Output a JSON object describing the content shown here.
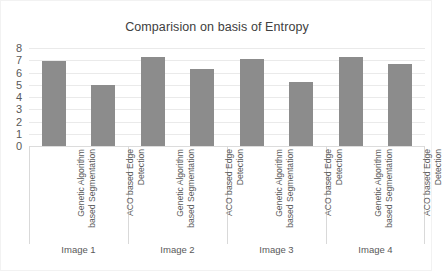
{
  "chart_data": {
    "type": "bar",
    "title": "Comparision on basis of Entropy",
    "xlabel": "",
    "ylabel": "",
    "ylim": [
      0,
      8
    ],
    "yticks": [
      "0",
      "1",
      "2",
      "3",
      "4",
      "5",
      "6",
      "7",
      "8"
    ],
    "grid": true,
    "legend": "none",
    "bar_color": "#8c8c8c",
    "groups": [
      "Image 1",
      "Image 2",
      "Image 3",
      "Image 4"
    ],
    "categories": [
      "Genetic Algorithm based Segmentation",
      "ACO based Edge Detection",
      "Genetic Algorithm based Segmentation",
      "ACO based Edge Detection",
      "Genetic Algorithm based Segmentation",
      "ACO based Edge Detection",
      "Genetic Algorithm based Segmentation",
      "ACO based Edge Detection"
    ],
    "category_lines": [
      [
        "Genetic Algorithm",
        "based Segmentation"
      ],
      [
        "ACO based Edge",
        "Detection"
      ],
      [
        "Genetic Algorithm",
        "based Segmentation"
      ],
      [
        "ACO based Edge",
        "Detection"
      ],
      [
        "Genetic Algorithm",
        "based Segmentation"
      ],
      [
        "ACO based Edge",
        "Detection"
      ],
      [
        "Genetic Algorithm",
        "based Segmentation"
      ],
      [
        "ACO based Edge",
        "Detection"
      ]
    ],
    "values": [
      6.9,
      5.0,
      7.3,
      6.3,
      7.1,
      5.2,
      7.3,
      6.7
    ],
    "series": [
      {
        "name": "Entropy",
        "values": [
          6.9,
          5.0,
          7.3,
          6.3,
          7.1,
          5.2,
          7.3,
          6.7
        ]
      }
    ]
  },
  "axis": {
    "y_tick_0": "0",
    "y_tick_1": "1",
    "y_tick_2": "2",
    "y_tick_3": "3",
    "y_tick_4": "4",
    "y_tick_5": "5",
    "y_tick_6": "6",
    "y_tick_7": "7",
    "y_tick_8": "8"
  }
}
